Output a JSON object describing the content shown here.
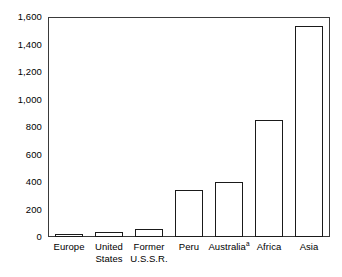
{
  "chart_data": {
    "type": "bar",
    "title": "",
    "subtitle": "",
    "xlabel": "",
    "ylabel": "",
    "ylim": [
      0,
      1600
    ],
    "grid": false,
    "legend": "none",
    "orientation": "vertical",
    "bar_style": "white fill with black outline",
    "categories": [
      "Europe",
      "United States",
      "Former U.S.S.R.",
      "Peru",
      "Australia",
      "Africa",
      "Asia"
    ],
    "values": [
      25,
      40,
      60,
      345,
      400,
      855,
      1545
    ],
    "yticks": [
      0,
      200,
      400,
      600,
      800,
      1000,
      1200,
      1400,
      1600
    ],
    "ytick_labels": [
      "0",
      "200",
      "400",
      "600",
      "800",
      "1,000",
      "1,200",
      "1,400",
      "1,600"
    ],
    "annotations": [
      {
        "category": "Australia",
        "marker": "a",
        "type": "footnote-superscript"
      }
    ]
  },
  "axis": {
    "y_tick_labels": [
      "1,600",
      "1,400",
      "1,200",
      "1,000",
      "800",
      "600",
      "400",
      "200",
      "0"
    ],
    "y_tick_values": [
      1600,
      1400,
      1200,
      1000,
      800,
      600,
      400,
      200,
      0
    ]
  },
  "categories_display": [
    {
      "line1": "Europe",
      "line2": "",
      "superscript": ""
    },
    {
      "line1": "United",
      "line2": "States",
      "superscript": ""
    },
    {
      "line1": "Former",
      "line2": "U.S.S.R.",
      "superscript": ""
    },
    {
      "line1": "Peru",
      "line2": "",
      "superscript": ""
    },
    {
      "line1": "Australia",
      "line2": "",
      "superscript": "a"
    },
    {
      "line1": "Africa",
      "line2": "",
      "superscript": ""
    },
    {
      "line1": "Asia",
      "line2": "",
      "superscript": ""
    }
  ],
  "colors": {
    "bar_fill": "#ffffff",
    "bar_outline": "#1a1a1a",
    "frame": "#3a3a3a",
    "text": "#000000",
    "background": "#ffffff"
  }
}
